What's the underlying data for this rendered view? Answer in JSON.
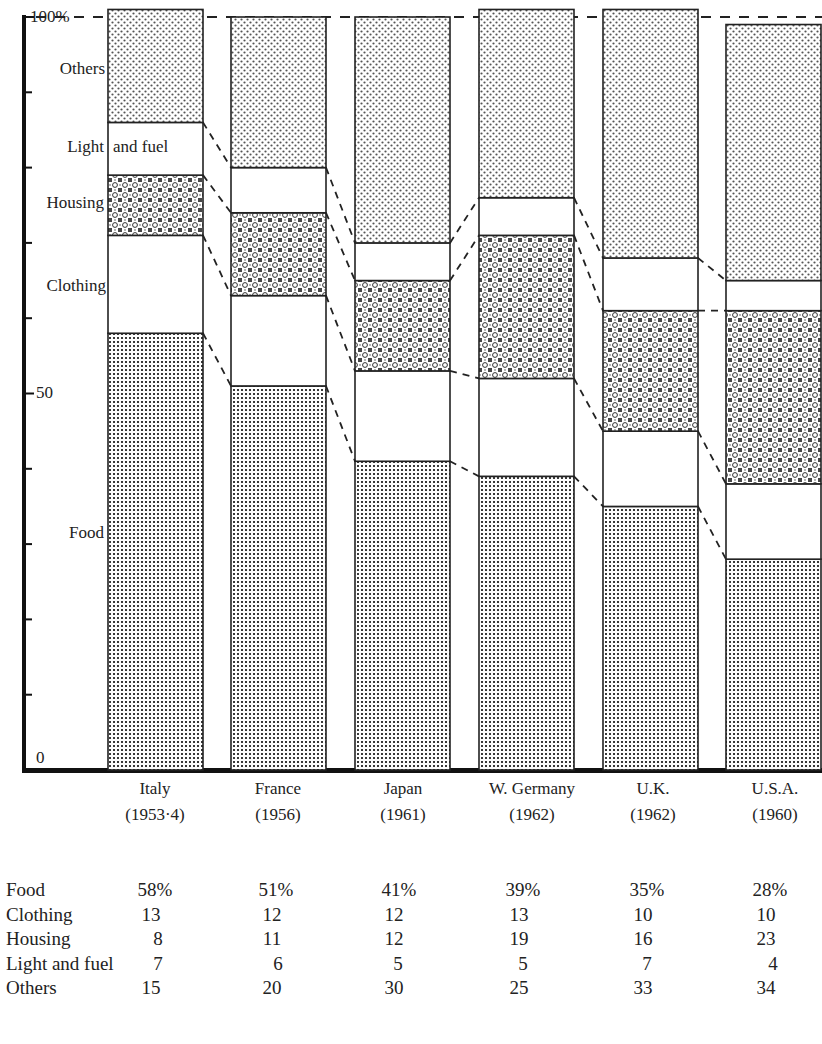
{
  "chart_data": {
    "type": "bar",
    "stacked": true,
    "percent_stacked": true,
    "title": "",
    "xlabel": "",
    "ylabel": "",
    "ylim": [
      0,
      100
    ],
    "y_tick_labels": [
      "0",
      "50",
      "100%"
    ],
    "y_ticks_minor_every": 10,
    "categories": [
      "Italy (1953-4)",
      "France (1956)",
      "Japan (1961)",
      "W. Germany (1962)",
      "U.K. (1962)",
      "U.S.A. (1960)"
    ],
    "category_names": [
      "Italy",
      "France",
      "Japan",
      "W. Germany",
      "U.K.",
      "U.S.A."
    ],
    "category_years": [
      "(1953-4)",
      "(1956)",
      "(1961)",
      "(1962)",
      "(1962)",
      "(1960)"
    ],
    "series": [
      {
        "name": "Food",
        "values": [
          58,
          51,
          41,
          39,
          35,
          28
        ],
        "pattern": "dense-dot-grid"
      },
      {
        "name": "Clothing",
        "values": [
          13,
          12,
          12,
          13,
          10,
          10
        ],
        "pattern": "blank"
      },
      {
        "name": "Housing",
        "values": [
          8,
          11,
          12,
          19,
          16,
          23
        ],
        "pattern": "circle-cross"
      },
      {
        "name": "Light and fuel",
        "values": [
          7,
          6,
          5,
          5,
          7,
          4
        ],
        "pattern": "blank"
      },
      {
        "name": "Others",
        "values": [
          15,
          20,
          30,
          25,
          33,
          34
        ],
        "pattern": "sparse-dot"
      }
    ],
    "legend_position": "left of first bar (inline labels)",
    "grid": false,
    "connectors": "dashed lines joining segment boundaries between adjacent bars"
  },
  "axis": {
    "top_label": "100%",
    "mid_label": "50",
    "bottom_label": "0"
  },
  "legend_labels": {
    "others": "Others",
    "light_and_fuel_left": "Light",
    "light_and_fuel_right": "and fuel",
    "housing": "Housing",
    "clothing": "Clothing",
    "food": "Food"
  },
  "x_labels": [
    {
      "name": "Italy",
      "year": "(1953·4)"
    },
    {
      "name": "France",
      "year": "(1956)"
    },
    {
      "name": "Japan",
      "year": "(1961)"
    },
    {
      "name": "W. Germany",
      "year": "(1962)"
    },
    {
      "name": "U.K.",
      "year": "(1962)"
    },
    {
      "name": "U.S.A.",
      "year": "(1960)"
    }
  ],
  "table": {
    "rows": [
      {
        "label": "Food",
        "values": [
          "58%",
          "51%",
          "41%",
          "39%",
          "35%",
          "28%"
        ]
      },
      {
        "label": "Clothing",
        "values": [
          "13",
          "12",
          "12",
          "13",
          "10",
          "10"
        ]
      },
      {
        "label": "Housing",
        "values": [
          "8",
          "11",
          "12",
          "19",
          "16",
          "23"
        ]
      },
      {
        "label": "Light and fuel",
        "values": [
          "7",
          "6",
          "5",
          "5",
          "7",
          "4"
        ]
      },
      {
        "label": "Others",
        "values": [
          "15",
          "20",
          "30",
          "25",
          "33",
          "34"
        ]
      }
    ]
  }
}
